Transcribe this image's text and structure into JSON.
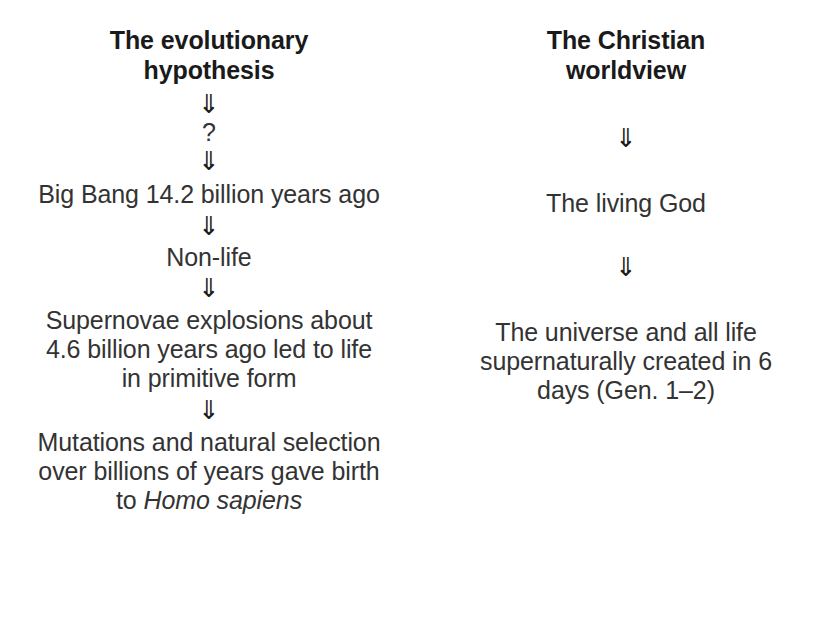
{
  "diagram": {
    "type": "two-column-flowchart",
    "arrow_glyph": "⇓",
    "text_color": "#333333",
    "heading_color": "#1a1a1a",
    "background_color": "#ffffff",
    "columns": [
      {
        "id": "evolutionary-hypothesis",
        "heading": "The evolutionary hypothesis",
        "steps": [
          {
            "kind": "arrow",
            "label": "⇓"
          },
          {
            "kind": "node",
            "label": "?"
          },
          {
            "kind": "arrow",
            "label": "⇓"
          },
          {
            "kind": "node",
            "label": "Big Bang 14.2 billion years ago"
          },
          {
            "kind": "arrow",
            "label": "⇓"
          },
          {
            "kind": "node",
            "label": "Non-life"
          },
          {
            "kind": "arrow",
            "label": "⇓"
          },
          {
            "kind": "node",
            "label": "Supernovae explosions about 4.6 billion years ago led to life in primitive form"
          },
          {
            "kind": "arrow",
            "label": "⇓"
          },
          {
            "kind": "node",
            "label_prefix": "Mutations and natural selection over billions of years gave birth to ",
            "label_italic": "Homo sapiens"
          }
        ]
      },
      {
        "id": "christian-worldview",
        "heading": "The Christian worldview",
        "steps": [
          {
            "kind": "arrow",
            "label": "⇓"
          },
          {
            "kind": "node",
            "label": "The living God"
          },
          {
            "kind": "arrow",
            "label": "⇓"
          },
          {
            "kind": "node",
            "label": "The universe and all life supernaturally created in 6 days (Gen. 1–2)"
          }
        ]
      }
    ]
  }
}
